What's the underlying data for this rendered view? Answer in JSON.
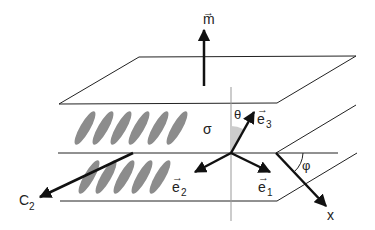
{
  "diagram": {
    "labels": {
      "m": "m",
      "sigma": "σ",
      "theta": "θ",
      "e3": "e",
      "e3_sub": "3",
      "e2": "e",
      "e2_sub": "2",
      "e1": "e",
      "e1_sub": "1",
      "phi": "φ",
      "c2": "C",
      "c2_sub": "2",
      "x": "x",
      "vec_arrow": "→"
    },
    "colors": {
      "line": "#222222",
      "ellipse_fill": "#8c8c8c",
      "axis_gray": "#999999",
      "angle_fill": "#cccccc"
    }
  }
}
